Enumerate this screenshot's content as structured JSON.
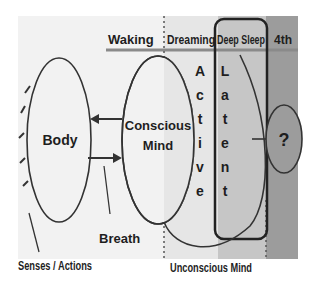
{
  "diagram": {
    "states": [
      {
        "id": "waking",
        "label": "Waking"
      },
      {
        "id": "dreaming",
        "label": "Dreaming"
      },
      {
        "id": "deep-sleep",
        "label": "Deep Sleep"
      },
      {
        "id": "fourth",
        "label": "4th"
      }
    ],
    "nodes": {
      "body": "Body",
      "conscious_line1": "Conscious",
      "conscious_line2": "Mind",
      "unknown": "?"
    },
    "vertical_labels": {
      "active": [
        "A",
        "c",
        "t",
        "i",
        "v",
        "e"
      ],
      "latent": [
        "L",
        "a",
        "t",
        "e",
        "n",
        "t"
      ]
    },
    "annotations": {
      "breath": "Breath",
      "senses_actions": "Senses / Actions",
      "unconscious_mind": "Unconscious Mind"
    },
    "colors": {
      "waking_bg": "#f2f2f2",
      "dreaming_bg": "#e4e4e4",
      "deep_sleep_bg": "#c4c4c4",
      "fourth_bg": "#9a9a9a",
      "line": "#333333",
      "divider": "#8a8a8a"
    }
  }
}
